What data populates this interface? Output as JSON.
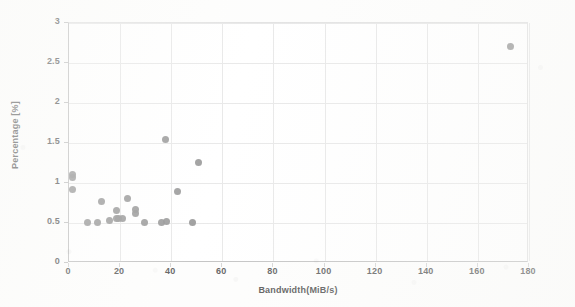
{
  "chart_data": {
    "type": "scatter",
    "title": "",
    "xlabel": "Bandwidth(MiB/s)",
    "ylabel": "Percentage [%]",
    "xlim": [
      0,
      180
    ],
    "ylim": [
      0,
      3
    ],
    "xticks": [
      0,
      20,
      40,
      60,
      80,
      100,
      120,
      140,
      160,
      180
    ],
    "yticks": [
      0,
      0.5,
      1,
      1.5,
      2,
      2.5,
      3
    ],
    "xtick_labels": [
      "0",
      "20",
      "40",
      "60",
      "80",
      "100",
      "120",
      "140",
      "160",
      "180"
    ],
    "ytick_labels": [
      "0",
      "0.5",
      "1",
      "1.5",
      "2",
      "2.5",
      "3"
    ],
    "grid": true,
    "legend": null,
    "marker": {
      "shape": "circle",
      "color": "#7f7f7f",
      "size": 7
    },
    "series": [
      {
        "name": "samples",
        "points": [
          {
            "x": 1.6,
            "y": 1.1
          },
          {
            "x": 1.6,
            "y": 1.06
          },
          {
            "x": 1.6,
            "y": 0.91
          },
          {
            "x": 7.8,
            "y": 0.49
          },
          {
            "x": 11.7,
            "y": 0.49
          },
          {
            "x": 13.3,
            "y": 0.76
          },
          {
            "x": 16.4,
            "y": 0.52
          },
          {
            "x": 18.8,
            "y": 0.64
          },
          {
            "x": 19.1,
            "y": 0.54
          },
          {
            "x": 19.9,
            "y": 0.54
          },
          {
            "x": 21.5,
            "y": 0.54
          },
          {
            "x": 23.1,
            "y": 0.79
          },
          {
            "x": 26.6,
            "y": 0.66
          },
          {
            "x": 26.6,
            "y": 0.61
          },
          {
            "x": 30.1,
            "y": 0.5
          },
          {
            "x": 36.4,
            "y": 0.5
          },
          {
            "x": 38.0,
            "y": 1.53
          },
          {
            "x": 38.7,
            "y": 0.51
          },
          {
            "x": 43.0,
            "y": 0.88
          },
          {
            "x": 48.9,
            "y": 0.5
          },
          {
            "x": 50.9,
            "y": 1.25
          },
          {
            "x": 173.0,
            "y": 2.69
          }
        ]
      }
    ]
  }
}
